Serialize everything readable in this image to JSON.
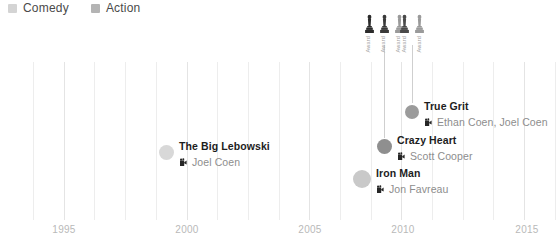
{
  "legend": {
    "position": "top-left",
    "items": [
      {
        "label": "Comedy",
        "color": "#d4d4d4",
        "swatch_icon": "square-swatch-icon"
      },
      {
        "label": "Action",
        "color": "#b4b4b4",
        "swatch_icon": "square-swatch-icon"
      }
    ]
  },
  "axis": {
    "ticks": [
      {
        "label": "1995",
        "x": 64
      },
      {
        "label": "2000",
        "x": 187
      },
      {
        "label": "2005",
        "x": 310
      },
      {
        "label": "2010",
        "x": 403
      },
      {
        "label": "2015",
        "x": 527
      }
    ],
    "xlim": [
      1993,
      2016
    ],
    "grid": true,
    "grid_color": "#ededed",
    "tick_color": "#b9b9b9"
  },
  "awards": {
    "icon_name": "oscar-statuette-icon",
    "groups": [
      {
        "stem_x": 384,
        "stem_top": 45,
        "stem_bottom": 138,
        "film": "Crazy Heart",
        "items": [
          {
            "label": "Award",
            "color": "#2b2b2b"
          },
          {
            "label": "Award",
            "color": "#3a3a3a"
          },
          {
            "label": "Award",
            "color": "#9a9a9a"
          }
        ]
      },
      {
        "stem_x": 412,
        "stem_top": 45,
        "stem_bottom": 103,
        "film": "True Grit",
        "items": [
          {
            "label": "Award",
            "color": "#4a4a4a"
          },
          {
            "label": "Award",
            "color": "#9a9a9a"
          }
        ]
      }
    ]
  },
  "films": [
    {
      "title": "The Big Lebowski",
      "director": "Joel Coen",
      "genre": "Comedy",
      "year": 1998,
      "dot_x": 159,
      "dot_y": 136,
      "dot_size": 15,
      "dot_color": "#d8d8d8",
      "director_icon": "film-camera-icon"
    },
    {
      "title": "Crazy Heart",
      "director": "Scott Cooper",
      "genre": "Comedy",
      "year": 2009,
      "dot_x": 377,
      "dot_y": 130,
      "dot_size": 15,
      "dot_color": "#8f8f8f",
      "director_icon": "film-camera-icon"
    },
    {
      "title": "True Grit",
      "director": "Ethan Coen, Joel Coen",
      "genre": "Comedy",
      "year": 2010,
      "dot_x": 405,
      "dot_y": 96,
      "dot_size": 14,
      "dot_color": "#9b9b9b",
      "director_icon": "film-camera-icon"
    },
    {
      "title": "Iron Man",
      "director": "Jon Favreau",
      "genre": "Action",
      "year": 2008,
      "dot_x": 353,
      "dot_y": 163,
      "dot_size": 18,
      "dot_color": "#c9c9c9",
      "director_icon": "film-camera-icon"
    }
  ],
  "chart_data": {
    "type": "scatter",
    "title": "",
    "xlabel": "",
    "ylabel": "",
    "xlim": [
      1993,
      2016
    ],
    "grid": true,
    "legend_position": "top-left",
    "categories": [
      "Comedy",
      "Action"
    ],
    "series": [
      {
        "name": "Comedy",
        "color": "#d4d4d4",
        "points": [
          {
            "label": "The Big Lebowski",
            "director": "Joel Coen",
            "x": 1998,
            "y": 136,
            "size": 15,
            "awards": 0
          },
          {
            "label": "Crazy Heart",
            "director": "Scott Cooper",
            "x": 2009,
            "y": 130,
            "size": 15,
            "awards": 3
          },
          {
            "label": "True Grit",
            "director": "Ethan Coen, Joel Coen",
            "x": 2010,
            "y": 96,
            "size": 14,
            "awards": 2
          }
        ]
      },
      {
        "name": "Action",
        "color": "#b4b4b4",
        "points": [
          {
            "label": "Iron Man",
            "director": "Jon Favreau",
            "x": 2008,
            "y": 163,
            "size": 18,
            "awards": 0
          }
        ]
      }
    ],
    "annotations": [
      {
        "text": "Award",
        "attached_to": "Crazy Heart"
      },
      {
        "text": "Award",
        "attached_to": "Crazy Heart"
      },
      {
        "text": "Award",
        "attached_to": "Crazy Heart"
      },
      {
        "text": "Award",
        "attached_to": "True Grit"
      },
      {
        "text": "Award",
        "attached_to": "True Grit"
      }
    ],
    "xticks": [
      "1995",
      "2000",
      "2005",
      "2010",
      "2015"
    ]
  }
}
